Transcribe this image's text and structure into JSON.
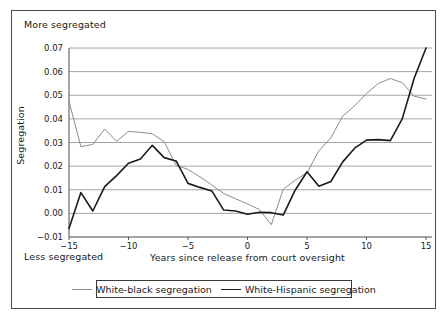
{
  "chart_data": {
    "type": "line",
    "title": "",
    "xlabel": "Years since release from court oversight",
    "ylabel": "Segregation",
    "xlim": [
      -15,
      15.5
    ],
    "ylim": [
      -0.01,
      0.07
    ],
    "xticks": [
      -15,
      -10,
      -5,
      0,
      5,
      10,
      15
    ],
    "xticklabels": [
      "−15",
      "−10",
      "−5",
      "0",
      "5",
      "10",
      "15"
    ],
    "yticks": [
      -0.01,
      0.0,
      0.01,
      0.02,
      0.03,
      0.04,
      0.05,
      0.06,
      0.07
    ],
    "yticklabels": [
      "−0.01",
      "0.00",
      "0.01",
      "0.02",
      "0.03",
      "0.04",
      "0.05",
      "0.06",
      "0.07"
    ],
    "grid": "horizontal",
    "legend_position": "below-axes",
    "annotations": {
      "top_left": "More segregated",
      "bottom_left": "Less segregated"
    },
    "x": [
      -15,
      -14,
      -13,
      -12,
      -11,
      -10,
      -9,
      -8,
      -7,
      -6,
      -5,
      -4,
      -3,
      -2,
      -1,
      0,
      1,
      2,
      3,
      4,
      5,
      6,
      7,
      8,
      9,
      10,
      11,
      12,
      13,
      14,
      15
    ],
    "series": [
      {
        "name": "White-black segregation",
        "color": "#8c8c8c",
        "width": 1,
        "values": [
          0.0475,
          0.0282,
          0.0292,
          0.0357,
          0.0305,
          0.0347,
          0.0343,
          0.0337,
          0.0303,
          0.0204,
          0.0186,
          0.0155,
          0.012,
          0.0084,
          0.0062,
          0.004,
          0.0016,
          -0.0048,
          0.0102,
          0.014,
          0.0172,
          0.0265,
          0.032,
          0.0412,
          0.0455,
          0.0508,
          0.055,
          0.0571,
          0.0553,
          0.0496,
          0.0484
        ]
      },
      {
        "name": "White-Hispanic segregation",
        "color": "#1a1a1a",
        "width": 1.6,
        "values": [
          -0.0064,
          0.0088,
          0.001,
          0.0113,
          0.016,
          0.0212,
          0.023,
          0.0288,
          0.0236,
          0.0222,
          0.0127,
          0.011,
          0.0095,
          0.0014,
          0.001,
          -0.0004,
          0.0005,
          0.0003,
          -0.0007,
          0.0098,
          0.0176,
          0.0115,
          0.0135,
          0.0218,
          0.0276,
          0.031,
          0.0312,
          0.0308,
          0.04,
          0.0572,
          0.07
        ]
      }
    ],
    "axes_pixels": {
      "left": 69,
      "right": 432,
      "top": 48,
      "bottom": 237
    }
  },
  "legend": {
    "entries": [
      {
        "label": "White-black segregation"
      },
      {
        "label": "White-Hispanic segregation"
      }
    ]
  }
}
